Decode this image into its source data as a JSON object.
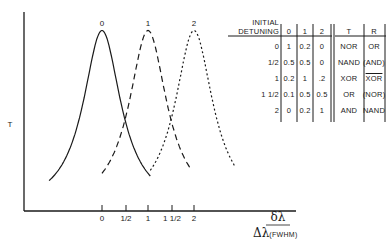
{
  "figure": {
    "y_axis_label": "T",
    "x_axis_label_numerator": "δλ",
    "x_axis_label_denominator": "Δλ",
    "x_axis_label_denominator_suffix": "(FWHM)",
    "x_ticks": [
      "0",
      "1/2",
      "1",
      "1 1/2",
      "2"
    ],
    "curve_labels": [
      "0",
      "1",
      "2"
    ]
  },
  "chart_data": {
    "type": "line",
    "title": "",
    "xlabel": "δλ / Δλ(FWHM)",
    "ylabel": "T",
    "x_ticks": [
      "0",
      "1/2",
      "1",
      "1 1/2",
      "2"
    ],
    "series": [
      {
        "name": "0",
        "style": "solid",
        "peak_x": 0
      },
      {
        "name": "1",
        "style": "dashed",
        "peak_x": 1
      },
      {
        "name": "2",
        "style": "dotted",
        "peak_x": 2
      }
    ],
    "grid": false,
    "table": {
      "headers": [
        "INITIAL DETUNING",
        "0",
        "1",
        "2",
        "T",
        "R"
      ],
      "rows": [
        [
          "0",
          "1",
          "0.2",
          "0",
          "NOR",
          "OR"
        ],
        [
          "1/2",
          "0.5",
          "0.5",
          "0",
          "NAND",
          "(AND)"
        ],
        [
          "1",
          "0.2",
          "1",
          ".2",
          "XOR",
          "XOR"
        ],
        [
          "1 1/2",
          "0.1",
          "0.5",
          "0.5",
          "OR",
          "(NOR)"
        ],
        [
          "2",
          "0",
          "0.2",
          "1",
          "AND",
          "NAND"
        ]
      ]
    }
  },
  "table": {
    "header_line1": "INITIAL",
    "header_line2": "DETUNING",
    "col_headers": [
      "0",
      "1",
      "2",
      "T",
      "R"
    ],
    "rows": [
      {
        "detuning": "0",
        "c0": "1",
        "c1": "0.2",
        "c2": "0",
        "t": "NOR",
        "r": "OR"
      },
      {
        "detuning": "1/2",
        "c0": "0.5",
        "c1": "0.5",
        "c2": "0",
        "t": "NAND",
        "r": "(AND)"
      },
      {
        "detuning": "1",
        "c0": "0.2",
        "c1": "1",
        "c2": ".2",
        "t": "XOR",
        "r": "XOR"
      },
      {
        "detuning": "1 1/2",
        "c0": "0.1",
        "c1": "0.5",
        "c2": "0.5",
        "t": "OR",
        "r": "(NOR)"
      },
      {
        "detuning": "2",
        "c0": "0",
        "c1": "0.2",
        "c2": "1",
        "t": "AND",
        "r": "NAND"
      }
    ]
  }
}
